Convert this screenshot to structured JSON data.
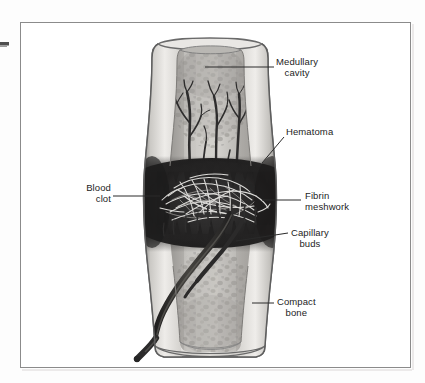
{
  "figure": {
    "title_alt": "Fracture hematoma formation in a long bone",
    "background_color": "#fdfdfd",
    "frame_color": "#8b8b8b",
    "label_text_color": "#1d1d1d",
    "leader_line_color": "#2a2a2a"
  },
  "labels": [
    {
      "id": "medullary-cavity",
      "line1": "Medullary",
      "line2": "cavity",
      "align": "left",
      "x": 276,
      "y": 56
    },
    {
      "id": "hematoma",
      "line1": "Hematoma",
      "line2": "",
      "align": "left",
      "x": 286,
      "y": 126
    },
    {
      "id": "blood-clot",
      "line1": "Blood",
      "line2": "clot",
      "align": "right",
      "x": 84,
      "y": 176
    },
    {
      "id": "fibrin-meshwork",
      "line1": "Fibrin",
      "line2": "meshwork",
      "align": "left",
      "x": 303,
      "y": 190
    },
    {
      "id": "capillary-buds",
      "line1": "Capillary",
      "line2": "buds",
      "align": "left",
      "x": 290,
      "y": 228
    },
    {
      "id": "compact-bone",
      "line1": "Compact",
      "line2": "bone",
      "align": "left",
      "x": 277,
      "y": 296
    }
  ],
  "anatomy": {
    "structures": [
      "compact bone cortex",
      "medullary cavity with trabecular texture",
      "fracture hematoma / blood clot",
      "fibrin meshwork strands",
      "capillary buds",
      "nutrient blood vessel"
    ]
  },
  "colors": {
    "bone_outline": "#4a4a4a",
    "cortex_light": "#e8e6e3",
    "cortex_mid": "#cfcdc9",
    "marrow_light": "#d9d7d3",
    "marrow_mid": "#b3b1ad",
    "marrow_dark": "#9a9894",
    "hematoma_dark": "#2b2a2a",
    "hematoma_mid": "#4e4d4d",
    "fibrin_light": "#e9e7e4",
    "vessel_dark": "#3a3838"
  }
}
